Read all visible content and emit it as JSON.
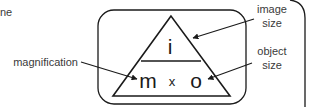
{
  "diagram": {
    "fragment_text": "ne",
    "triangle": {
      "top": "i",
      "bottom_left": "m",
      "operator": "x",
      "bottom_right": "o"
    },
    "labels": {
      "magnification": "magnification",
      "image_size_line1": "image",
      "image_size_line2": "size",
      "object_size_line1": "object",
      "object_size_line2": "size"
    },
    "colors": {
      "stroke": "#1a1a1a",
      "text": "#3a3a3a",
      "background": "#ffffff"
    }
  }
}
